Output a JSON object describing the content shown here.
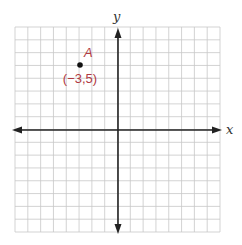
{
  "chart_data": {
    "type": "scatter",
    "title": "",
    "xlabel": "x",
    "ylabel": "y",
    "xlim": [
      -8,
      8
    ],
    "ylim": [
      -8,
      8
    ],
    "grid": true,
    "grid_step": 1,
    "points": [
      {
        "name": "A",
        "x": -3,
        "y": 5,
        "label": "(−3,5)"
      }
    ]
  },
  "axes": {
    "x_label": "x",
    "y_label": "y"
  },
  "point_a": {
    "name": "A",
    "coord_label": "(−3,5)"
  },
  "colors": {
    "grid": "#c8c8c8",
    "axis": "#222222",
    "point": "#111111",
    "label": "#b03a43"
  }
}
